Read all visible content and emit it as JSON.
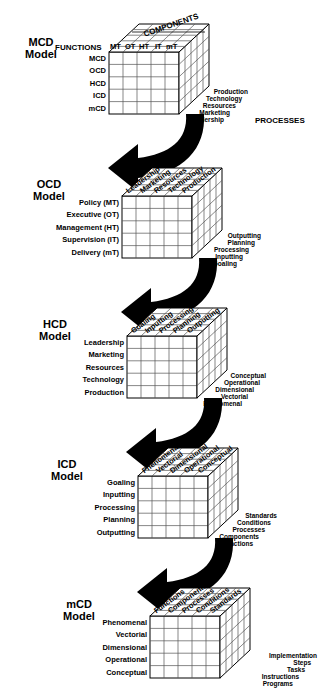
{
  "diagram": {
    "title_hidden": "",
    "models": [
      {
        "id": "mcd",
        "name": "MCD\nModel",
        "axis_left_label": "FUNCTIONS",
        "axis_top_label": "COMPONENTS",
        "axis_right_label": "PROCESSES",
        "rows": [
          "MCD",
          "OCD",
          "HCD",
          "ICD",
          "mCD"
        ],
        "columns": [
          "MT",
          "OT",
          "HT",
          "IT",
          "mT"
        ],
        "depth": [
          "Production",
          "Technology",
          "Resources",
          "Marketing",
          "Leadership"
        ],
        "top_label_style": "horizontal"
      },
      {
        "id": "ocd",
        "name": "OCD\nModel",
        "axis_left_label": "",
        "axis_top_label": "",
        "axis_right_label": "",
        "rows": [
          "Policy (MT)",
          "Executive (OT)",
          "Management (HT)",
          "Supervision (IT)",
          "Delivery (mT)"
        ],
        "columns": [
          "Leadership",
          "Marketing",
          "Resources",
          "Technology",
          "Production"
        ],
        "depth": [
          "Outputting",
          "Planning",
          "Processing",
          "Inputting",
          "Goaling"
        ],
        "top_label_style": "diagonal"
      },
      {
        "id": "hcd",
        "name": "HCD\nModel",
        "axis_left_label": "",
        "axis_top_label": "",
        "axis_right_label": "",
        "rows": [
          "Leadership",
          "Marketing",
          "Resources",
          "Technology",
          "Production"
        ],
        "columns": [
          "Goaling",
          "Inputting",
          "Processing",
          "Planning",
          "Outputting"
        ],
        "depth": [
          "Conceptual",
          "Operational",
          "Dimensional",
          "Vectorial",
          "Phenomenal"
        ],
        "top_label_style": "diagonal"
      },
      {
        "id": "icd",
        "name": "ICD\nModel",
        "axis_left_label": "",
        "axis_top_label": "",
        "axis_right_label": "",
        "rows": [
          "Goaling",
          "Inputting",
          "Processing",
          "Planning",
          "Outputting"
        ],
        "columns": [
          "Phenomenal",
          "Vectorial",
          "Dimensional",
          "Operational",
          "Conceptual"
        ],
        "depth": [
          "Standards",
          "Conditions",
          "Processes",
          "Components",
          "Functions"
        ],
        "top_label_style": "diagonal"
      },
      {
        "id": "mcd2",
        "name": "mCD\nModel",
        "axis_left_label": "",
        "axis_top_label": "",
        "axis_right_label": "",
        "rows": [
          "Phenomenal",
          "Vectorial",
          "Dimensional",
          "Operational",
          "Conceptual"
        ],
        "columns": [
          "Functions",
          "Components",
          "Processes",
          "Conditions",
          "Standards"
        ],
        "depth": [
          "Implementation",
          "Steps",
          "Tasks",
          "Instructions",
          "Programs"
        ],
        "top_label_style": "diagonal"
      }
    ],
    "colors": {
      "ink": "#000000",
      "grid": "#3a3a3a",
      "face": "#ffffff",
      "arrow": "#000000",
      "background": "#ffffff"
    }
  }
}
